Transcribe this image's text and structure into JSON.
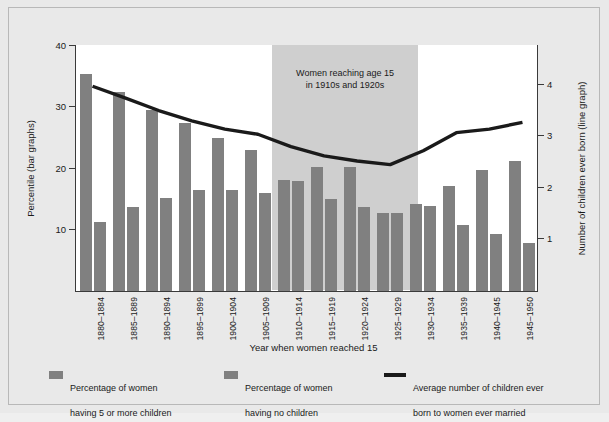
{
  "chart_data": {
    "type": "bar",
    "title": "",
    "xlabel": "Year when women reached 15",
    "ylabel": "Percentile (bar graphs)",
    "ylabel_right": "Number of children ever born (line graph)",
    "categories": [
      "1880–1884",
      "1885–1889",
      "1890–1894",
      "1895–1899",
      "1900–1904",
      "1905–1909",
      "1910–1914",
      "1915–1919",
      "1920–1924",
      "1925–1929",
      "1930–1934",
      "1935–1939",
      "1940–1945",
      "1945–1950"
    ],
    "ylim": [
      0,
      40
    ],
    "yticks": [
      10,
      20,
      30,
      40
    ],
    "ylim_right": [
      0,
      4.75
    ],
    "yticks_right": [
      1,
      2,
      3,
      4
    ],
    "grid": false,
    "legend_position": "bottom",
    "series": [
      {
        "name": "Percentage of women having 5 or more children",
        "type": "bar",
        "axis": "left",
        "color": "#808080",
        "values": [
          35.5,
          32.5,
          29.5,
          27.5,
          25.0,
          23.0,
          18.2,
          20.2,
          20.2,
          12.8,
          14.2,
          17.2,
          19.7,
          21.2
        ]
      },
      {
        "name": "Percentage of women having no children",
        "type": "bar",
        "axis": "left",
        "color": "#808080",
        "values": [
          11.3,
          13.7,
          15.2,
          16.5,
          16.5,
          16.0,
          18.0,
          15.0,
          13.7,
          12.8,
          13.8,
          10.7,
          9.3,
          7.8
        ]
      },
      {
        "name": "Average number of children ever born to women ever married",
        "type": "line",
        "axis": "right",
        "color": "#1a1a1a",
        "values": [
          3.95,
          3.72,
          3.48,
          3.28,
          3.12,
          3.02,
          2.78,
          2.6,
          2.5,
          2.43,
          2.7,
          3.05,
          3.12,
          3.25
        ]
      }
    ],
    "annotations": [
      {
        "text": "Women reaching age 15\nin 1910s and 1920s",
        "line1": "Women reaching age 15",
        "line2": "in 1910s and 1920s",
        "span_categories": [
          "1910–1914",
          "1925–1929"
        ],
        "shade_color": "#cfcfcf"
      }
    ]
  },
  "axes": {
    "left": {
      "title": "Percentile (bar graphs)",
      "ticks": [
        "10",
        "20",
        "30",
        "40"
      ]
    },
    "right": {
      "title": "Number of children ever born (line graph)",
      "ticks": [
        "1",
        "2",
        "3",
        "4"
      ]
    },
    "bottom": {
      "title": "Year when women reached 15",
      "ticks": [
        "1880–1884",
        "1885–1889",
        "1890–1894",
        "1895–1899",
        "1900–1904",
        "1905–1909",
        "1910–1914",
        "1915–1919",
        "1920–1924",
        "1925–1929",
        "1930–1934",
        "1935–1939",
        "1940–1945",
        "1945–1950"
      ]
    }
  },
  "annotation": {
    "line1": "Women reaching age 15",
    "line2": "in 1910s and 1920s"
  },
  "legend": {
    "items": [
      {
        "line1": "Percentage of women",
        "line2": "having 5 or more children",
        "swatch": "bar",
        "color": "#808080"
      },
      {
        "line1": "Percentage of women",
        "line2": "having no children",
        "swatch": "bar",
        "color": "#808080"
      },
      {
        "line1": "Average number of children ever",
        "line2": "born to women ever married",
        "swatch": "line",
        "color": "#1a1a1a"
      }
    ]
  },
  "colors": {
    "bar": "#808080",
    "line": "#1a1a1a",
    "shade": "#cfcfcf",
    "background": "#e9e9e9",
    "plot_background": "#ffffff",
    "axis": "#3a3a3a"
  }
}
